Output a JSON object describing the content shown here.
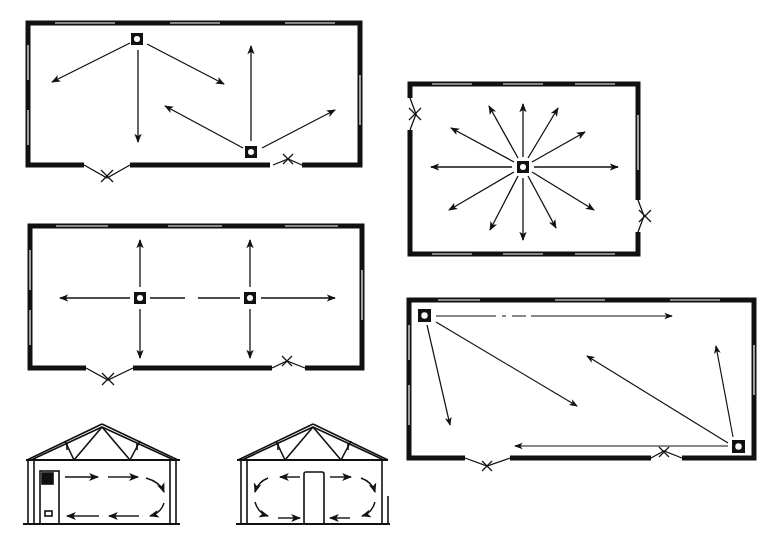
{
  "diagram": {
    "title": "",
    "colors": {
      "ink": "#111111",
      "background": "#ffffff",
      "window": "#ffffff"
    },
    "panels": [
      {
        "id": "plan-1",
        "type": "plan",
        "heaters": 2,
        "arrows": 6,
        "doors": 2
      },
      {
        "id": "plan-2",
        "type": "plan",
        "heaters": 1,
        "arrows": 12,
        "doors": 2
      },
      {
        "id": "plan-3",
        "type": "plan",
        "heaters": 2,
        "arrows": 6,
        "doors": 2
      },
      {
        "id": "plan-4",
        "type": "plan",
        "heaters": 2,
        "arrows": 6,
        "doors": 2
      },
      {
        "id": "section-1",
        "type": "section",
        "heater_position": "left wall",
        "circulation": "single loop"
      },
      {
        "id": "section-2",
        "type": "section",
        "heater_position": "center",
        "circulation": "double loop"
      }
    ]
  }
}
